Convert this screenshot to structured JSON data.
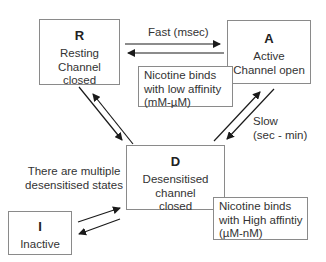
{
  "states": {
    "R": {
      "letter": "R",
      "line1": "Resting",
      "line2": "Channel",
      "line3": "closed"
    },
    "A": {
      "letter": "A",
      "line1": "Active",
      "line2": "Channel open"
    },
    "D": {
      "letter": "D",
      "line1": "Desensitised",
      "line2": "channel",
      "line3": "closed"
    },
    "I": {
      "letter": "I",
      "line1": "Inactive"
    }
  },
  "transitions": {
    "R_A": {
      "label": "Fast (msec)"
    },
    "A_D": {
      "label_line1": "Slow",
      "label_line2": "(sec - min)"
    },
    "R_D": {
      "label": ""
    },
    "D_I": {
      "label": ""
    }
  },
  "notes": {
    "low_affinity": {
      "line1": "Nicotine binds",
      "line2": "with low affinity",
      "line3": "(mM-µM)"
    },
    "high_affinity": {
      "line1": "Nicotine binds",
      "line2": "with High affintiy",
      "line3": "(µM-nM)"
    },
    "multiple_states": {
      "line1": "There are multiple",
      "line2": "desensitised states"
    }
  },
  "colors": {
    "line": "#1a1a1a",
    "border": "#8a8a8a",
    "text": "#333333"
  }
}
